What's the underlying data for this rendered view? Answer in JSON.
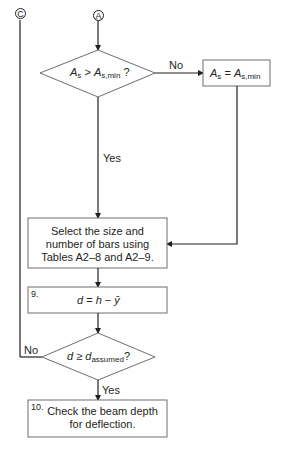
{
  "connectors": {
    "c": "C",
    "a": "A"
  },
  "decision1": {
    "lhs": "A",
    "lhs_sub": "s",
    "op": " > ",
    "rhs": "A",
    "rhs_sub": "s,min",
    "suffix": " ?",
    "no_label": "No",
    "yes_label": "Yes"
  },
  "assign_box": {
    "lhs": "A",
    "lhs_sub": "s",
    "op": " = ",
    "rhs": "A",
    "rhs_sub": "s,min"
  },
  "select_box": {
    "lines": [
      "Select the size and",
      "number of bars using",
      "Tables A2–8 and A2–9."
    ]
  },
  "step9": {
    "number": "9.",
    "d": "d",
    "eq": " = ",
    "h": "h",
    "minus": " − ",
    "ybar": "ȳ"
  },
  "decision2": {
    "d": "d",
    "op": " ≥ ",
    "d2": "d",
    "d2_sub": "assumed",
    "suffix": "?",
    "no_label": "No",
    "yes_label": "Yes"
  },
  "step10": {
    "number": "10.",
    "lines": [
      "Check the beam depth",
      "for deflection."
    ]
  },
  "colors": {
    "stroke": "#231f20",
    "box_border": "#6d6e71"
  }
}
